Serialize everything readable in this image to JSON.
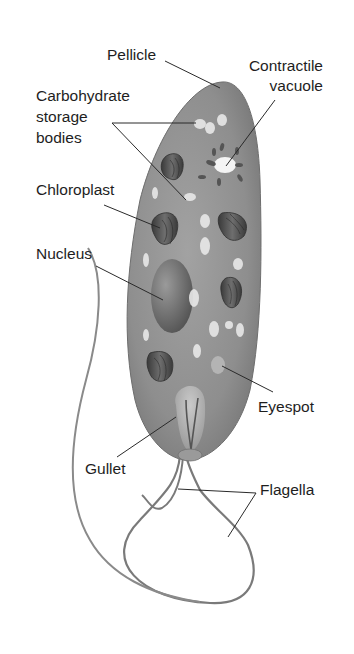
{
  "labels": {
    "pellicle": "Pellicle",
    "contractile_vacuole": [
      "Contractile",
      "vacuole"
    ],
    "carbohydrate_storage_bodies": [
      "Carbohydrate",
      "storage",
      "bodies"
    ],
    "chloroplast": "Chloroplast",
    "nucleus": "Nucleus",
    "eyespot": "Eyespot",
    "gullet": "Gullet",
    "flagella": "Flagella"
  },
  "colors": {
    "body": "#8c8c8c",
    "body_light": "#bdbdbd",
    "organelle_dark": "#4a4a4a",
    "granule": "#e6e6e6",
    "leader_line": "#2a2a2a",
    "text": "#1e1e1e"
  }
}
